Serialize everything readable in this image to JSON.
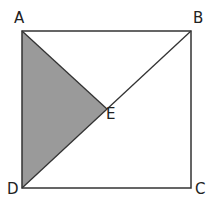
{
  "diagram": {
    "type": "geometry",
    "colors": {
      "stroke": "#333333",
      "shade": "#9a9a9a",
      "background": "#ffffff",
      "label": "#222222"
    },
    "points": {
      "A": {
        "label": "A",
        "x": 22,
        "y": 31,
        "label_x": 14,
        "label_y": 11
      },
      "B": {
        "label": "B",
        "x": 191,
        "y": 31,
        "label_x": 193,
        "label_y": 11
      },
      "C": {
        "label": "C",
        "x": 191,
        "y": 188,
        "label_x": 195,
        "label_y": 182
      },
      "D": {
        "label": "D",
        "x": 22,
        "y": 188,
        "label_x": 7,
        "label_y": 182
      },
      "E": {
        "label": "E",
        "x": 107,
        "y": 109,
        "label_x": 106,
        "label_y": 107
      }
    },
    "shaded_region": [
      "A",
      "E",
      "D"
    ],
    "segments": [
      [
        "A",
        "B"
      ],
      [
        "B",
        "C"
      ],
      [
        "C",
        "D"
      ],
      [
        "D",
        "A"
      ],
      [
        "D",
        "B"
      ],
      [
        "A",
        "E"
      ]
    ]
  }
}
